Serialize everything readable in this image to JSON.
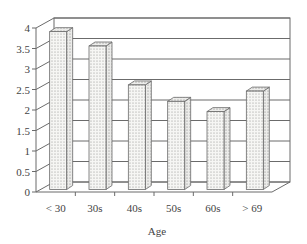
{
  "chart_data": {
    "type": "bar",
    "style": "3d-column",
    "title": "",
    "xlabel": "Age",
    "ylabel": "",
    "categories": [
      "< 30",
      "30s",
      "40s",
      "50s",
      "60s",
      "> 69"
    ],
    "values": [
      3.85,
      3.5,
      2.55,
      2.15,
      1.9,
      2.4
    ],
    "ylim": [
      0,
      4
    ],
    "yticks": [
      "0",
      "0.5",
      "1",
      "1.5",
      "2",
      "2.5",
      "3",
      "3.5",
      "4"
    ],
    "grid": true,
    "legend": null,
    "bar_fill": "dotted pattern",
    "colors": {
      "line": "#6b6b6b",
      "bar_face": "#f4f4f2",
      "dot": "#8a8a8a",
      "text": "#444444"
    }
  }
}
